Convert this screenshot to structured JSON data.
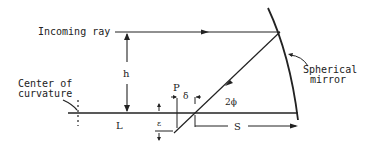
{
  "diagram": {
    "labels": {
      "incoming_ray": "Incoming ray",
      "center_line1": "Center of",
      "center_line2": "curvature",
      "mirror_line1": "Spherical",
      "mirror_line2": "mirror",
      "h": "h",
      "L": "L",
      "P": "P",
      "delta": "δ",
      "epsilon": "ε",
      "two_phi": "2ϕ",
      "S": "S"
    },
    "colors": {
      "line": "#222222",
      "background": "#ffffff"
    }
  }
}
